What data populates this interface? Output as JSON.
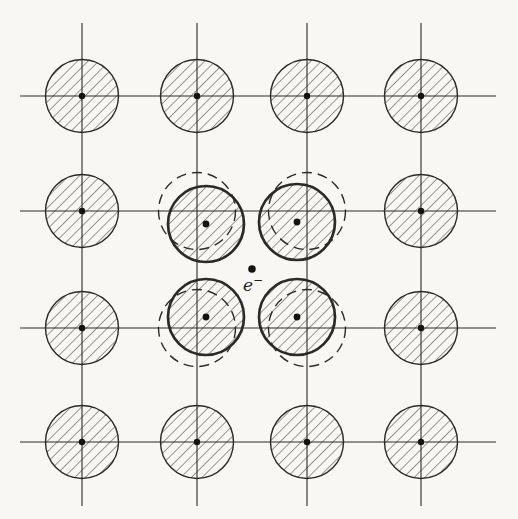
{
  "diagram": {
    "canvas": {
      "width": 518,
      "height": 519
    },
    "colors": {
      "paper": "#f8f7f4",
      "ink": "#2c2a26",
      "dot": "#15130f"
    },
    "grid": {
      "vertical_x": [
        82,
        197,
        307,
        421
      ],
      "horizontal_y": [
        96,
        211,
        328,
        442
      ],
      "h_extent": [
        20,
        496
      ],
      "v_extent": [
        23,
        506
      ],
      "stroke_width": 1.1
    },
    "ion_style": {
      "radius": 36.5,
      "outline_width": 1.4,
      "dot_radius": 3.2,
      "hatch_spacing": 7.5,
      "hatch_width": 0.95
    },
    "ions_normal": [
      [
        82,
        96
      ],
      [
        197,
        96
      ],
      [
        307,
        96
      ],
      [
        421,
        96
      ],
      [
        82,
        211
      ],
      [
        421,
        211
      ],
      [
        82,
        328
      ],
      [
        421,
        328
      ],
      [
        82,
        442
      ],
      [
        197,
        442
      ],
      [
        307,
        442
      ],
      [
        421,
        442
      ]
    ],
    "displaced_style": {
      "solid_radius": 38,
      "solid_width": 2.7,
      "dashed_radius": 38.5,
      "dashed_width": 1.4,
      "dash_pattern": "10 6",
      "dot_radius": 3.4
    },
    "ions_displaced": [
      {
        "lattice": [
          197,
          211
        ],
        "displaced": [
          206,
          224
        ]
      },
      {
        "lattice": [
          307,
          211
        ],
        "displaced": [
          297,
          222
        ]
      },
      {
        "lattice": [
          197,
          328
        ],
        "displaced": [
          206,
          317
        ]
      },
      {
        "lattice": [
          307,
          328
        ],
        "displaced": [
          297,
          317
        ]
      }
    ],
    "electron": {
      "x": 252,
      "y": 269,
      "dot_radius": 3.8,
      "label_base": "e",
      "label_sup": "−",
      "label_x": 243,
      "label_y": 291,
      "label_font_size": 17,
      "sup_font_size": 12
    }
  }
}
